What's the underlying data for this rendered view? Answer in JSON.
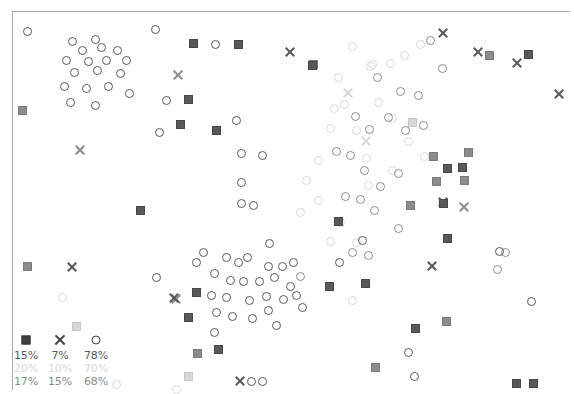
{
  "figure": {
    "background_color": "#ffffff",
    "frame_color": "#a8a8a8"
  },
  "legend": {
    "marker_symbols": [
      {
        "name": "filled-square",
        "glyph": "square"
      },
      {
        "name": "x-cross",
        "glyph": "cross"
      },
      {
        "name": "open-circle",
        "glyph": "circle"
      }
    ],
    "rows": [
      {
        "series": "dark",
        "color": "#595959",
        "values": [
          "15%",
          "7%",
          "78%"
        ]
      },
      {
        "series": "light",
        "color": "#d8d8d8",
        "values": [
          "20%",
          "10%",
          "70%"
        ]
      },
      {
        "series": "mid",
        "color": "#8c8c8c",
        "values": [
          "17%",
          "15%",
          "68%"
        ]
      }
    ]
  },
  "chart_data": {
    "type": "scatter",
    "title": "",
    "xlabel": "",
    "ylabel": "",
    "grid": false,
    "axis_ticks": false,
    "legend_position": "bottom-left",
    "xlim": [
      0,
      574
    ],
    "ylim": [
      0,
      392
    ],
    "note": "Pixel-space scatter: three groups distinguished by gray shade, each drawn with square, cross and circle markers.",
    "series": [
      {
        "name": "dark",
        "color": "#595959",
        "markers": {
          "square": [
            [
              193,
              43
            ],
            [
              238,
              44
            ],
            [
              312,
              65
            ],
            [
              528,
              54
            ],
            [
              188,
              99
            ],
            [
              216,
              130
            ],
            [
              180,
              124
            ],
            [
              140,
              210
            ],
            [
              338,
              221
            ],
            [
              188,
              317
            ],
            [
              218,
              349
            ],
            [
              329,
              286
            ],
            [
              365,
              283
            ],
            [
              447,
              238
            ],
            [
              415,
              328
            ],
            [
              443,
              203
            ],
            [
              462,
              167
            ],
            [
              516,
              383
            ],
            [
              533,
              383
            ],
            [
              196,
              292
            ],
            [
              447,
              168
            ]
          ],
          "cross": [
            [
              290,
              52
            ],
            [
              443,
              33
            ],
            [
              478,
              52
            ],
            [
              559,
              94
            ],
            [
              72,
              267
            ],
            [
              432,
              266
            ],
            [
              443,
              202
            ],
            [
              240,
              381
            ],
            [
              517,
              63
            ],
            [
              174,
              298
            ]
          ],
          "circle": [
            [
              27,
              31
            ],
            [
              72,
              41
            ],
            [
              95,
              39
            ],
            [
              155,
              29
            ],
            [
              82,
              50
            ],
            [
              101,
              47
            ],
            [
              117,
              50
            ],
            [
              66,
              60
            ],
            [
              88,
              61
            ],
            [
              106,
              60
            ],
            [
              126,
              60
            ],
            [
              74,
              72
            ],
            [
              97,
              70
            ],
            [
              120,
              73
            ],
            [
              64,
              86
            ],
            [
              86,
              88
            ],
            [
              108,
              86
            ],
            [
              129,
              93
            ],
            [
              166,
              100
            ],
            [
              70,
              102
            ],
            [
              95,
              105
            ],
            [
              159,
              132
            ],
            [
              215,
              44
            ],
            [
              236,
              120
            ],
            [
              241,
              153
            ],
            [
              262,
              155
            ],
            [
              241,
              182
            ],
            [
              241,
              203
            ],
            [
              253,
              205
            ],
            [
              269,
              243
            ],
            [
              362,
              240
            ],
            [
              499,
              251
            ],
            [
              531,
              301
            ],
            [
              408,
              352
            ],
            [
              414,
              376
            ],
            [
              251,
              381
            ],
            [
              262,
              381
            ],
            [
              226,
              257
            ],
            [
              238,
              262
            ],
            [
              247,
              257
            ],
            [
              268,
              266
            ],
            [
              282,
              266
            ],
            [
              293,
              262
            ],
            [
              214,
              273
            ],
            [
              230,
              280
            ],
            [
              243,
              281
            ],
            [
              259,
              281
            ],
            [
              274,
              277
            ],
            [
              290,
              286
            ],
            [
              211,
              295
            ],
            [
              226,
              297
            ],
            [
              249,
              300
            ],
            [
              266,
              296
            ],
            [
              283,
              299
            ],
            [
              216,
              312
            ],
            [
              232,
              316
            ],
            [
              252,
              318
            ],
            [
              268,
              310
            ],
            [
              276,
              325
            ],
            [
              214,
              332
            ],
            [
              296,
              295
            ],
            [
              302,
              307
            ],
            [
              339,
              262
            ],
            [
              156,
              277
            ],
            [
              203,
              252
            ],
            [
              196,
              262
            ]
          ]
        }
      },
      {
        "name": "mid",
        "color": "#8c8c8c",
        "markers": {
          "square": [
            [
              313,
              64
            ],
            [
              410,
              205
            ],
            [
              436,
              181
            ],
            [
              464,
              180
            ],
            [
              433,
              156
            ],
            [
              468,
              152
            ],
            [
              489,
              55
            ],
            [
              27,
              266
            ],
            [
              22,
              110
            ],
            [
              197,
              353
            ],
            [
              375,
              367
            ],
            [
              446,
              321
            ]
          ],
          "cross": [
            [
              178,
              75
            ],
            [
              80,
              150
            ],
            [
              176,
              299
            ],
            [
              464,
              207
            ]
          ],
          "circle": [
            [
              377,
              77
            ],
            [
              400,
              91
            ],
            [
              418,
              95
            ],
            [
              430,
              40
            ],
            [
              442,
              68
            ],
            [
              388,
              117
            ],
            [
              355,
              116
            ],
            [
              369,
              129
            ],
            [
              405,
              130
            ],
            [
              423,
              125
            ],
            [
              350,
              155
            ],
            [
              336,
              151
            ],
            [
              364,
              170
            ],
            [
              380,
              186
            ],
            [
              398,
              173
            ],
            [
              345,
              196
            ],
            [
              360,
              199
            ],
            [
              374,
              210
            ],
            [
              398,
              228
            ],
            [
              352,
              252
            ],
            [
              368,
              255
            ],
            [
              300,
              276
            ],
            [
              497,
              269
            ],
            [
              505,
              252
            ]
          ]
        }
      },
      {
        "name": "light",
        "color": "#d8d8d8",
        "markers": {
          "square": [
            [
              412,
              122
            ],
            [
              76,
              326
            ],
            [
              188,
              376
            ]
          ],
          "cross": [
            [
              348,
              93
            ],
            [
              366,
              141
            ]
          ],
          "circle": [
            [
              352,
              46
            ],
            [
              338,
              77
            ],
            [
              344,
              104
            ],
            [
              356,
              130
            ],
            [
              366,
              158
            ],
            [
              378,
              102
            ],
            [
              390,
              63
            ],
            [
              404,
              55
            ],
            [
              420,
              44
            ],
            [
              408,
              141
            ],
            [
              424,
              156
            ],
            [
              392,
              170
            ],
            [
              372,
              64
            ],
            [
              330,
              128
            ],
            [
              318,
              160
            ],
            [
              306,
              180
            ],
            [
              318,
              200
            ],
            [
              340,
              222
            ],
            [
              356,
              242
            ],
            [
              330,
              241
            ],
            [
              300,
              212
            ],
            [
              352,
              300
            ],
            [
              370,
              66
            ],
            [
              334,
              108
            ],
            [
              392,
              118
            ],
            [
              368,
              185
            ],
            [
              62,
              297
            ],
            [
              116,
              384
            ],
            [
              176,
              389
            ]
          ]
        }
      }
    ]
  }
}
